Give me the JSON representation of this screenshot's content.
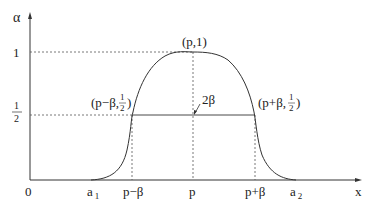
{
  "diagram": {
    "axes": {
      "y_label": "α",
      "x_label": "x",
      "origin_label": "0",
      "y_ticks": {
        "one": "1",
        "half_num": "1",
        "half_den": "2"
      },
      "x_ticks": {
        "a1_main": "a",
        "a1_sub": "1",
        "p_minus_beta": "p−β",
        "p": "p",
        "p_plus_beta": "p+β",
        "a2_main": "a",
        "a2_sub": "2"
      }
    },
    "annotations": {
      "peak": "(p,1)",
      "left_half_prefix": "(p−β,",
      "right_half_prefix": "(p+β,",
      "half_num": "1",
      "half_den": "2",
      "close_paren": ")",
      "width": "2β"
    },
    "colors": {
      "stroke": "#333333",
      "text": "#222222",
      "background": "#ffffff"
    }
  }
}
